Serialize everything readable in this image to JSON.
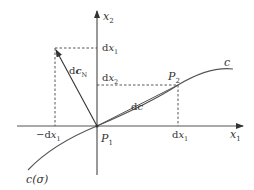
{
  "diagram": {
    "type": "coordinate-geometry",
    "axes": {
      "horizontal": {
        "name": "x",
        "subscript": "1"
      },
      "vertical": {
        "name": "x",
        "subscript": "2"
      }
    },
    "points": {
      "p1": {
        "name": "P",
        "subscript": "1"
      },
      "p2": {
        "name": "P",
        "subscript": "2"
      }
    },
    "curve": {
      "label": "c",
      "param_label": "c(σ)"
    },
    "vectors": {
      "tangent": {
        "prefix": "d",
        "name": "c"
      },
      "normal": {
        "prefix": "d",
        "name": "c",
        "subscript": "N"
      }
    },
    "tick_labels": {
      "x_pos": {
        "prefix": "d",
        "name": "x",
        "subscript": "1"
      },
      "x_neg": {
        "prefix": "−d",
        "name": "x",
        "subscript": "1"
      },
      "y_top": {
        "prefix": "d",
        "name": "x",
        "subscript": "1"
      },
      "y_mid": {
        "prefix": "d",
        "name": "x",
        "subscript": "2"
      }
    },
    "colors": {
      "line": "#444444",
      "text": "#333333"
    }
  }
}
